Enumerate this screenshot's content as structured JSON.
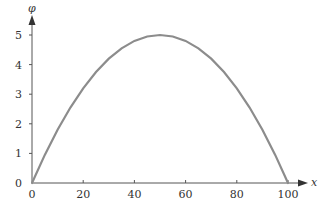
{
  "chart_data": {
    "type": "line",
    "title": "",
    "xlabel": "x",
    "ylabel": "φ",
    "xlim": [
      0,
      100
    ],
    "ylim": [
      0,
      5
    ],
    "x_ticks": [
      0,
      20,
      40,
      60,
      80,
      100
    ],
    "y_ticks": [
      0,
      1,
      2,
      3,
      4,
      5
    ],
    "grid": false,
    "legend": null,
    "series": [
      {
        "name": "φ(x)",
        "color": "#8c8c8c",
        "x": [
          0,
          5,
          10,
          15,
          20,
          25,
          30,
          35,
          40,
          45,
          50,
          55,
          60,
          65,
          70,
          75,
          80,
          85,
          90,
          95,
          100
        ],
        "values": [
          0,
          0.95,
          1.8,
          2.55,
          3.2,
          3.75,
          4.2,
          4.55,
          4.8,
          4.95,
          5.0,
          4.95,
          4.8,
          4.55,
          4.2,
          3.75,
          3.2,
          2.55,
          1.8,
          0.95,
          0
        ]
      }
    ]
  },
  "labels": {
    "x_axis": "x",
    "y_axis": "φ",
    "x_ticks": [
      "0",
      "20",
      "40",
      "60",
      "80",
      "100"
    ],
    "y_ticks": [
      "0",
      "1",
      "2",
      "3",
      "4",
      "5"
    ]
  }
}
